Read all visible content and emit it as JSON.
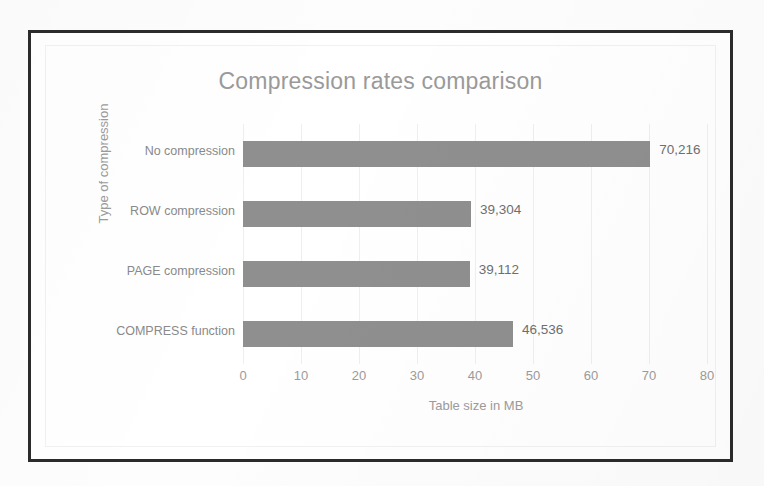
{
  "chart_data": {
    "type": "bar",
    "orientation": "horizontal",
    "title": "Compression rates comparison",
    "xlabel": "Table size in MB",
    "ylabel": "Type of compression",
    "categories": [
      "No compression",
      "ROW compression",
      "PAGE compression",
      "COMPRESS function"
    ],
    "values": [
      70.216,
      39.304,
      39.112,
      46.536
    ],
    "value_labels": [
      "70,216",
      "39,304",
      "39,112",
      "46,536"
    ],
    "xlim": [
      0,
      80
    ],
    "xticks": [
      0,
      10,
      20,
      30,
      40,
      50,
      60,
      70,
      80
    ],
    "xtick_labels": [
      "0",
      "10",
      "20",
      "30",
      "40",
      "50",
      "60",
      "70",
      "80"
    ],
    "grid": "vertical",
    "legend": "none",
    "bar_color": "#8f8f8f",
    "title_color": "#9a9a9a",
    "axis_text_color": "#9b9b9b",
    "gridline_color": "#efefef",
    "frame_color": "#2b2b2b"
  }
}
